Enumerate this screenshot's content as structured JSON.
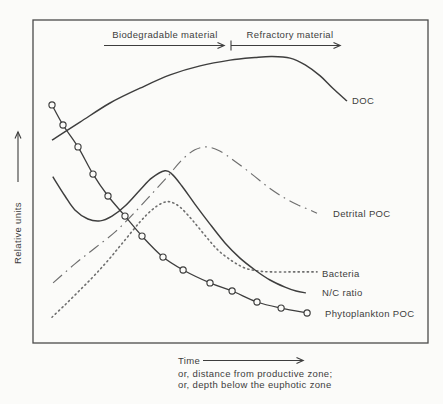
{
  "figure": {
    "background": "#fbfbf9",
    "line_color": "#3e3e3e",
    "muted_line_color": "#6e6e6e",
    "border_color": "#4a4a4a",
    "text_color": "#3d3d3d"
  },
  "y_axis": {
    "title": "Relative units"
  },
  "x_axis": {
    "title": "Time",
    "alt1": "or, distance from productive zone;",
    "alt2": "or, depth below the euphotic zone"
  },
  "zone_annotations": {
    "biodegradable": "Biodegradable material",
    "refractory": "Refractory material"
  },
  "chart_data": {
    "type": "line",
    "title": "",
    "xlabel": "Time; or, distance from productive zone; or, depth below the euphotic zone",
    "ylabel": "Relative units",
    "axis_note": "unitless relative axes; x and y given as 0-1 fractions of plotted span",
    "grid": false,
    "legend_position": "labels-at-line-ends",
    "series": [
      {
        "id": "detrital-poc",
        "label": "Detrital POC",
        "style": "dash-dot",
        "points": [
          [
            0.051,
            0.186
          ],
          [
            0.106,
            0.245
          ],
          [
            0.157,
            0.294
          ],
          [
            0.208,
            0.344
          ],
          [
            0.251,
            0.396
          ],
          [
            0.296,
            0.455
          ],
          [
            0.342,
            0.517
          ],
          [
            0.377,
            0.567
          ],
          [
            0.41,
            0.598
          ],
          [
            0.441,
            0.607
          ],
          [
            0.473,
            0.594
          ],
          [
            0.511,
            0.563
          ],
          [
            0.554,
            0.523
          ],
          [
            0.595,
            0.483
          ],
          [
            0.633,
            0.452
          ],
          [
            0.671,
            0.427
          ],
          [
            0.701,
            0.412
          ],
          [
            0.719,
            0.402
          ]
        ]
      },
      {
        "id": "bacteria",
        "label": "Bacteria",
        "style": "dotted",
        "points": [
          [
            0.048,
            0.08
          ],
          [
            0.081,
            0.118
          ],
          [
            0.119,
            0.164
          ],
          [
            0.157,
            0.211
          ],
          [
            0.195,
            0.263
          ],
          [
            0.233,
            0.319
          ],
          [
            0.271,
            0.375
          ],
          [
            0.301,
            0.412
          ],
          [
            0.327,
            0.433
          ],
          [
            0.347,
            0.437
          ],
          [
            0.372,
            0.421
          ],
          [
            0.403,
            0.381
          ],
          [
            0.435,
            0.334
          ],
          [
            0.468,
            0.288
          ],
          [
            0.504,
            0.254
          ],
          [
            0.537,
            0.232
          ],
          [
            0.57,
            0.223
          ],
          [
            0.605,
            0.22
          ],
          [
            0.651,
            0.22
          ],
          [
            0.689,
            0.22
          ],
          [
            0.719,
            0.22
          ]
        ]
      },
      {
        "id": "doc",
        "label": "DOC",
        "style": "solid",
        "points": [
          [
            0.048,
            0.628
          ],
          [
            0.119,
            0.684
          ],
          [
            0.195,
            0.743
          ],
          [
            0.271,
            0.789
          ],
          [
            0.347,
            0.83
          ],
          [
            0.423,
            0.858
          ],
          [
            0.499,
            0.876
          ],
          [
            0.562,
            0.884
          ],
          [
            0.605,
            0.887
          ],
          [
            0.651,
            0.882
          ],
          [
            0.689,
            0.861
          ],
          [
            0.727,
            0.827
          ],
          [
            0.759,
            0.789
          ],
          [
            0.795,
            0.749
          ]
        ]
      },
      {
        "id": "nc-ratio",
        "label": "N/C ratio",
        "style": "solid",
        "points": [
          [
            0.05,
            0.515
          ],
          [
            0.081,
            0.455
          ],
          [
            0.106,
            0.412
          ],
          [
            0.139,
            0.384
          ],
          [
            0.17,
            0.378
          ],
          [
            0.2,
            0.393
          ],
          [
            0.233,
            0.424
          ],
          [
            0.271,
            0.474
          ],
          [
            0.301,
            0.511
          ],
          [
            0.334,
            0.533
          ],
          [
            0.352,
            0.523
          ],
          [
            0.377,
            0.486
          ],
          [
            0.41,
            0.43
          ],
          [
            0.448,
            0.368
          ],
          [
            0.486,
            0.31
          ],
          [
            0.524,
            0.263
          ],
          [
            0.562,
            0.226
          ],
          [
            0.6,
            0.195
          ],
          [
            0.638,
            0.173
          ],
          [
            0.666,
            0.161
          ],
          [
            0.691,
            0.155
          ]
        ]
      },
      {
        "id": "phytoplankton-poc",
        "label": "Phytoplankton POC",
        "style": "solid-markers",
        "points": [
          [
            0.048,
            0.737
          ],
          [
            0.076,
            0.675
          ],
          [
            0.114,
            0.607
          ],
          [
            0.152,
            0.523
          ],
          [
            0.19,
            0.455
          ],
          [
            0.233,
            0.393
          ],
          [
            0.276,
            0.331
          ],
          [
            0.329,
            0.266
          ],
          [
            0.38,
            0.226
          ],
          [
            0.448,
            0.186
          ],
          [
            0.504,
            0.161
          ],
          [
            0.567,
            0.127
          ],
          [
            0.628,
            0.108
          ],
          [
            0.694,
            0.093
          ]
        ]
      }
    ]
  }
}
